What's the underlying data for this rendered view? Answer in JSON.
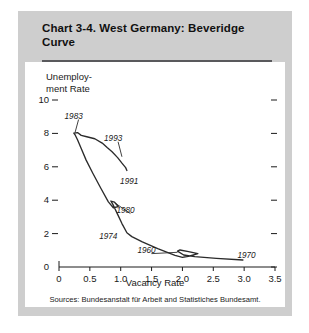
{
  "title": "Chart 3-4.  West Germany:  Beveridge Curve",
  "source": "Sources:  Bundesanstalt für Arbeit and Statistiches Bundesamt.",
  "colors": {
    "card_background": "#cecece",
    "panel_background": "#ffffff",
    "rule": "#59595c",
    "ink": "#1a1a1a",
    "curve": "#2b2b2b"
  },
  "chart_data": {
    "type": "line",
    "title": "Chart 3-4.  West Germany:  Beveridge Curve",
    "xlabel": "Vacancy Rate",
    "ylabel": "Unemploy- ment Rate",
    "ylabel_line1": "Unemploy-",
    "ylabel_line2": "ment Rate",
    "xlim": [
      0,
      3.5
    ],
    "ylim": [
      0,
      10
    ],
    "xticks": [
      "0",
      "0.5",
      "1.0",
      "1.5",
      "2.0",
      "2.5",
      "3.0",
      "3.5"
    ],
    "xtick_values": [
      0,
      0.5,
      1.0,
      1.5,
      2.0,
      2.5,
      3.0,
      3.5
    ],
    "yticks": [
      "0",
      "2",
      "4",
      "6",
      "8",
      "10"
    ],
    "ytick_values": [
      0,
      2,
      4,
      6,
      8,
      10
    ],
    "grid": false,
    "legend": "none",
    "right_axis_ticks": true,
    "series": [
      {
        "name": "Beveridge curve",
        "points": [
          [
            2.98,
            0.42
          ],
          [
            2.55,
            0.52
          ],
          [
            2.2,
            0.62
          ],
          [
            2.02,
            0.72
          ],
          [
            1.92,
            0.95
          ],
          [
            1.96,
            1.02
          ],
          [
            2.1,
            0.92
          ],
          [
            2.25,
            0.8
          ],
          [
            2.12,
            0.66
          ],
          [
            2.0,
            0.58
          ],
          [
            1.88,
            0.7
          ],
          [
            1.6,
            1.1
          ],
          [
            1.35,
            1.5
          ],
          [
            1.18,
            1.82
          ],
          [
            1.1,
            2.05
          ],
          [
            1.02,
            2.6
          ],
          [
            0.95,
            3.15
          ],
          [
            0.88,
            3.7
          ],
          [
            0.84,
            3.95
          ],
          [
            0.9,
            3.88
          ],
          [
            0.96,
            3.62
          ],
          [
            0.88,
            3.55
          ],
          [
            0.8,
            3.9
          ],
          [
            0.68,
            4.7
          ],
          [
            0.55,
            5.6
          ],
          [
            0.44,
            6.4
          ],
          [
            0.36,
            7.1
          ],
          [
            0.3,
            7.62
          ],
          [
            0.26,
            7.92
          ],
          [
            0.24,
            8.02
          ],
          [
            0.3,
            8.05
          ],
          [
            0.36,
            7.88
          ],
          [
            0.45,
            7.8
          ],
          [
            0.58,
            7.68
          ],
          [
            0.7,
            7.42
          ],
          [
            0.78,
            7.15
          ],
          [
            0.86,
            6.9
          ],
          [
            0.95,
            6.55
          ],
          [
            1.02,
            6.22
          ],
          [
            1.08,
            5.95
          ],
          [
            1.1,
            5.78
          ]
        ]
      }
    ],
    "annotations": [
      {
        "label": "1983",
        "x": 0.22,
        "y": 8.95,
        "point_x": 0.26,
        "point_y": 8.05,
        "leader": true
      },
      {
        "label": "1993",
        "x": 0.86,
        "y": 7.62,
        "point_x": 1.02,
        "point_y": 6.6,
        "leader": true
      },
      {
        "label": "1991",
        "x": 1.12,
        "y": 5.05,
        "point_x": 1.1,
        "point_y": 5.78,
        "leader": false
      },
      {
        "label": "1980",
        "x": 1.06,
        "y": 3.32,
        "point_x": 0.92,
        "point_y": 3.8,
        "leader": true
      },
      {
        "label": "1974",
        "x": 0.78,
        "y": 1.72,
        "point_x": 1.1,
        "point_y": 2.05,
        "leader": false
      },
      {
        "label": "1960",
        "x": 1.4,
        "y": 0.92,
        "point_x": 1.92,
        "point_y": 0.88,
        "leader": true
      },
      {
        "label": "1970",
        "x": 3.02,
        "y": 0.62,
        "point_x": 2.98,
        "point_y": 0.44,
        "leader": false
      }
    ]
  }
}
